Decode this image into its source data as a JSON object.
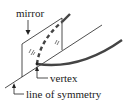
{
  "diagram": {
    "labels": {
      "mirror": "mirror",
      "vertex": "vertex",
      "symmetry": "line of symmetry"
    },
    "colors": {
      "line": "#222222",
      "curve": "#444444",
      "background": "#ffffff"
    }
  }
}
